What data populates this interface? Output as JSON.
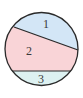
{
  "diagram": {
    "type": "circle-divided-by-chords",
    "canvas": {
      "width": 83,
      "height": 98,
      "background": "#ffffff"
    },
    "circle": {
      "cx": 41.5,
      "cy": 49,
      "r": 36.5,
      "stroke": "#2a2a2a",
      "stroke_width": 1.3
    },
    "chords": [
      {
        "name": "upper-chord",
        "x1": 14,
        "y1": 27,
        "x2": 78,
        "y2": 50
      },
      {
        "name": "lower-chord",
        "x1": 12.4,
        "y1": 71,
        "x2": 70.6,
        "y2": 71
      }
    ],
    "regions": [
      {
        "id": "1",
        "label": "1",
        "fill": "#d3e6f6",
        "label_x": 46,
        "label_y": 28
      },
      {
        "id": "2",
        "label": "2",
        "fill": "#f9d4d7",
        "label_x": 29,
        "label_y": 55
      },
      {
        "id": "3",
        "label": "3",
        "fill": "#ddf1f1",
        "label_x": 41,
        "label_y": 83
      }
    ]
  }
}
